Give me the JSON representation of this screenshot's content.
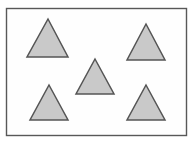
{
  "figure": {
    "title": "Five gray triangles arranged in a quincunx inside a rectangular frame",
    "canvas": {
      "width": 193,
      "height": 142,
      "background_color": "#ffffff"
    },
    "frame": {
      "name": "bounding-rectangle",
      "x": 6.5,
      "y": 8.5,
      "width": 180,
      "height": 127,
      "stroke_color": "#585858",
      "stroke_width": 1.4,
      "fill_color": "#fefefe"
    },
    "shape_style": {
      "fill_color": "#c9c9c9",
      "stroke_color": "#555555",
      "stroke_width": 1.5,
      "shape_kind": "triangle"
    },
    "shape_count": 5,
    "shapes": [
      {
        "id": "triangle-top-left",
        "label": "Top-left triangle",
        "apex_x": 48,
        "apex_y": 19,
        "base_y": 57,
        "base_left_x": 27,
        "base_right_x": 68,
        "points": "48,19 68,57 27,57"
      },
      {
        "id": "triangle-top-right",
        "label": "Top-right triangle",
        "apex_x": 146,
        "apex_y": 24,
        "base_y": 60,
        "base_left_x": 127,
        "base_right_x": 165,
        "points": "146,24 165,60 127,60"
      },
      {
        "id": "triangle-center",
        "label": "Center triangle",
        "apex_x": 95,
        "apex_y": 59,
        "base_y": 94,
        "base_left_x": 76,
        "base_right_x": 114,
        "points": "95,59 114,94 76,94"
      },
      {
        "id": "triangle-bottom-left",
        "label": "Bottom-left triangle",
        "apex_x": 49,
        "apex_y": 85,
        "base_y": 120,
        "base_left_x": 30,
        "base_right_x": 68,
        "points": "49,85 68,120 30,120"
      },
      {
        "id": "triangle-bottom-right",
        "label": "Bottom-right triangle",
        "apex_x": 146,
        "apex_y": 85,
        "base_y": 120,
        "base_left_x": 127,
        "base_right_x": 165,
        "points": "146,85 165,120 127,120"
      }
    ]
  }
}
